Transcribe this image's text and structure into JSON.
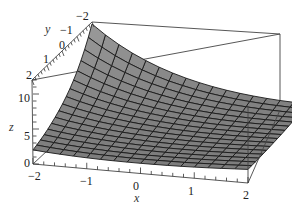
{
  "chart_data": {
    "type": "surface3d",
    "title": "",
    "xlabel": "x",
    "ylabel": "y",
    "zlabel": "z",
    "xlim": [
      -2,
      2
    ],
    "ylim": [
      -2,
      2
    ],
    "zlim": [
      0,
      12
    ],
    "x_ticks": [
      "-2",
      "-1",
      "0",
      "1",
      "2"
    ],
    "y_ticks": [
      "-2",
      "-1",
      "0",
      "1",
      "2"
    ],
    "z_ticks": [
      "0",
      "5",
      "10"
    ],
    "grid_divisions": 16,
    "surface_color": "#8c8c8c",
    "mesh_color": "#1a1a1a",
    "box_color": "#444444",
    "sample_values": [
      {
        "x": -2,
        "y": 2,
        "z": 4.5
      },
      {
        "x": -2,
        "y": -2,
        "z": 12
      },
      {
        "x": 2,
        "y": 2,
        "z": 2
      },
      {
        "x": 2,
        "y": -2,
        "z": 3
      },
      {
        "x": 0,
        "y": 0,
        "z": 2.5
      }
    ]
  },
  "labels": {
    "x_axis": "x",
    "y_axis": "y",
    "z_axis": "z",
    "x_tick_neg2": "−2",
    "x_tick_neg1": "−1",
    "x_tick_0": "0",
    "x_tick_1": "1",
    "x_tick_2": "2",
    "y_tick_neg2": "−2",
    "y_tick_neg1": "−1",
    "y_tick_0": "0",
    "y_tick_1": "1",
    "y_tick_2": "2",
    "z_tick_0": "0",
    "z_tick_5": "5",
    "z_tick_10": "10"
  }
}
